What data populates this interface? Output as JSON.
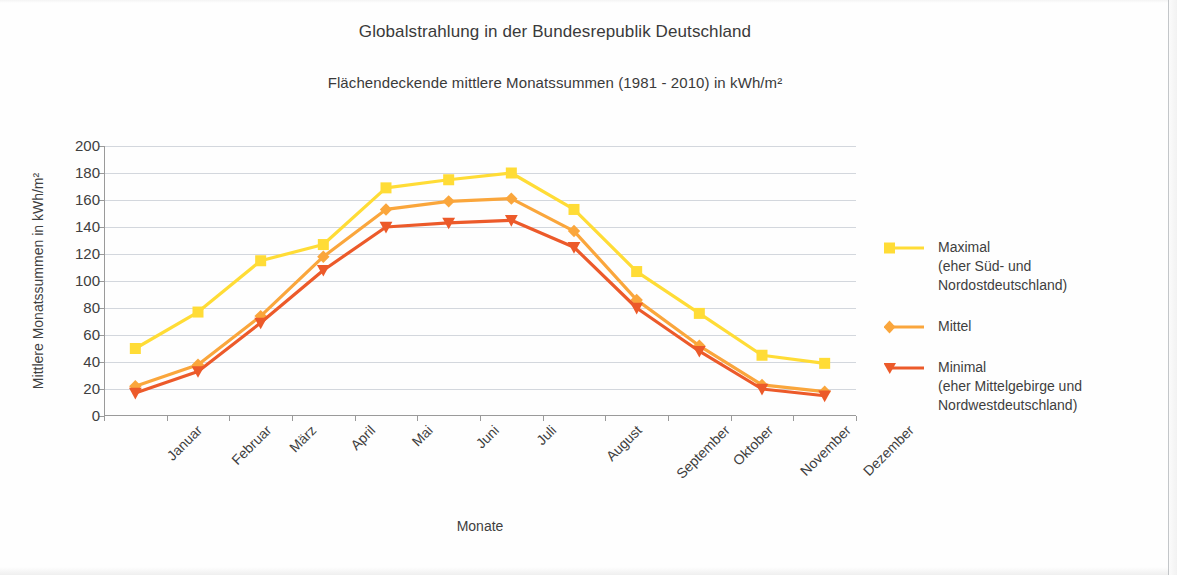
{
  "title": "Globalstrahlung in der Bundesrepublik Deutschland",
  "subtitle": "Flächendeckende mittlere Monatssummen (1981 - 2010) in kWh/m²",
  "legend": {
    "items": [
      {
        "name": "Maximal",
        "sub": "(eher Süd- und Nordostdeutschland)",
        "color": "#FFDC36",
        "marker": "square"
      },
      {
        "name": "Mittel",
        "sub": "",
        "color": "#FAA63C",
        "marker": "diamond"
      },
      {
        "name": "Minimal",
        "sub": "(eher Mittelgebirge und\nNordwestdeutschland)",
        "color": "#EC5A2A",
        "marker": "triangle-down"
      }
    ]
  },
  "chart_data": {
    "type": "line",
    "title": "Globalstrahlung in der Bundesrepublik Deutschland",
    "subtitle": "Flächendeckende mittlere Monatssummen (1981 - 2010) in kWh/m²",
    "xlabel": "Monate",
    "ylabel": "Mittlere Monatssummen in kWh/m²",
    "ylim": [
      0,
      200
    ],
    "ytick_step": 20,
    "yticks": [
      0,
      20,
      40,
      60,
      80,
      100,
      120,
      140,
      160,
      180,
      200
    ],
    "grid": "horizontal",
    "legend_position": "right",
    "xtick_rotation": -45,
    "categories": [
      "Januar",
      "Februar",
      "März",
      "April",
      "Mai",
      "Juni",
      "Juli",
      "August",
      "September",
      "Oktober",
      "November",
      "Dezember"
    ],
    "series": [
      {
        "name": "Maximal",
        "color": "#FFDC36",
        "marker": "square",
        "values": [
          50,
          77,
          115,
          127,
          169,
          175,
          180,
          153,
          107,
          76,
          45,
          39
        ]
      },
      {
        "name": "Mittel",
        "color": "#FAA63C",
        "marker": "diamond",
        "values": [
          22,
          38,
          74,
          118,
          153,
          159,
          161,
          137,
          86,
          52,
          23,
          18
        ]
      },
      {
        "name": "Minimal",
        "color": "#EC5A2A",
        "marker": "triangle-down",
        "values": [
          17,
          33,
          69,
          108,
          140,
          143,
          145,
          125,
          80,
          48,
          20,
          15
        ]
      }
    ]
  }
}
